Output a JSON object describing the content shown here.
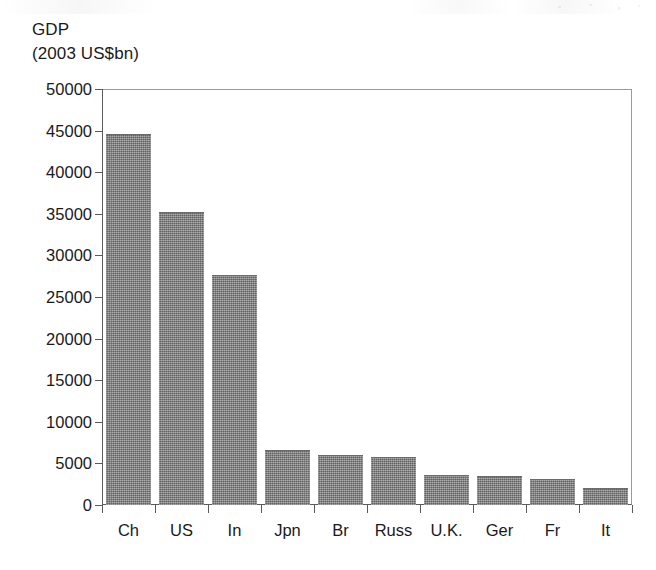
{
  "chart_data": {
    "type": "bar",
    "title": "",
    "ylabel_lines": [
      "GDP",
      "(2003 US$bn)"
    ],
    "xlabel": "",
    "ylabel": "GDP (2003 US$bn)",
    "categories": [
      "Ch",
      "US",
      "In",
      "Jpn",
      "Br",
      "Russ",
      "U.K.",
      "Ger",
      "Fr",
      "It"
    ],
    "values": [
      44600,
      35200,
      27700,
      6600,
      6000,
      5800,
      3600,
      3500,
      3100,
      2100
    ],
    "ylim": [
      0,
      50000
    ],
    "ytick_values": [
      0,
      5000,
      10000,
      15000,
      20000,
      25000,
      30000,
      35000,
      40000,
      45000,
      50000
    ],
    "ytick_labels": [
      "0",
      "5000",
      "10000",
      "15000",
      "20000",
      "25000",
      "30000",
      "35000",
      "40000",
      "45000",
      "50000"
    ],
    "grid": false,
    "legend": false,
    "legend_position": "none",
    "bar_color": "#7d7d7d",
    "axis_color": "#5a5a5a",
    "frame_color": "#9a9a9a",
    "background": "#ffffff"
  }
}
